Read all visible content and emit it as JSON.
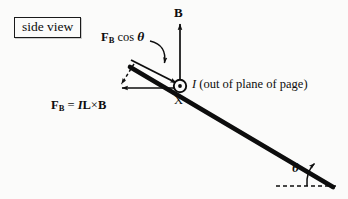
{
  "figure": {
    "caption_box": {
      "label": "side view"
    },
    "labels": {
      "force_component": {
        "symbol": "F",
        "subscript": "B",
        "operator": " cos ",
        "angle": "θ"
      },
      "magnetic_field": "B",
      "current": {
        "symbol": "I",
        "description": " (out of plane of page)"
      },
      "force_equation": {
        "symbol": "F",
        "subscript": "B",
        "equals": " = ",
        "current": "I",
        "length": "L",
        "cross": "×",
        "field": "B"
      },
      "rod_marker": "X",
      "incline_angle": "θ"
    },
    "geometry": {
      "rod": {
        "x1": 130,
        "y1": 67,
        "x2": 333,
        "y2": 187
      },
      "component_arrow": {
        "x1": 130,
        "y1": 61,
        "x2": 179,
        "y2": 85
      },
      "field_arrow": {
        "x1": 180,
        "y1": 86,
        "x2": 180,
        "y2": 23
      },
      "force_arrow": {
        "x1": 176,
        "y1": 88,
        "x2": 121,
        "y2": 88
      },
      "dashed_arrow": {
        "x1": 133,
        "y1": 65,
        "x2": 120,
        "y2": 86
      },
      "baseline_dashed": {
        "x1": 277,
        "y1": 186,
        "x2": 336,
        "y2": 186
      },
      "current_dot": {
        "cx": 180,
        "cy": 86,
        "r": 6
      },
      "angle_arc_center": {
        "cx": 333,
        "cy": 186,
        "r": 32
      }
    },
    "colors": {
      "ink": "#101010",
      "background": "#fbfbfa",
      "box_border": "#1a1a1a"
    }
  }
}
